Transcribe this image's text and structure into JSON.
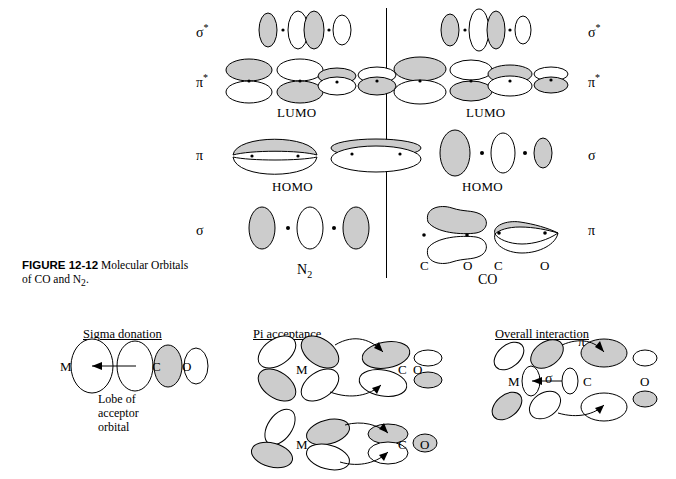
{
  "figure": {
    "caption_label": "FIGURE 12-12",
    "caption_text": " Molecular Orbitals of CO and N",
    "caption_sub": "2",
    "caption_end": "."
  },
  "panels": {
    "left": {
      "molecule": "N",
      "molecule_sub": "2",
      "orbital_labels": [
        {
          "id": "sigma-star",
          "text": "σ",
          "star": "*",
          "y": 30
        },
        {
          "id": "pi-star",
          "text": "π",
          "star": "*",
          "y": 80
        },
        {
          "id": "pi",
          "text": "π",
          "star": "",
          "y": 152
        },
        {
          "id": "sigma",
          "text": "σ",
          "star": "",
          "y": 228
        }
      ],
      "annotations": [
        {
          "id": "lumo",
          "text": "LUMO",
          "x": 277,
          "y": 112
        },
        {
          "id": "homo",
          "text": "HOMO",
          "x": 272,
          "y": 186
        }
      ]
    },
    "right": {
      "molecule": "CO",
      "atoms": [
        "C",
        "O",
        "C",
        "O"
      ],
      "orbital_labels": [
        {
          "id": "sigma-star",
          "text": "σ",
          "star": "*",
          "y": 30
        },
        {
          "id": "pi-star",
          "text": "π",
          "star": "*",
          "y": 80
        },
        {
          "id": "sigma",
          "text": "σ",
          "star": "",
          "y": 152
        },
        {
          "id": "pi",
          "text": "π",
          "star": "",
          "y": 228
        }
      ],
      "annotations": [
        {
          "id": "lumo",
          "text": "LUMO",
          "x": 466,
          "y": 112
        },
        {
          "id": "homo",
          "text": "HOMO",
          "x": 462,
          "y": 186
        }
      ]
    }
  },
  "bottom": {
    "sigma_donation": {
      "heading": "Sigma donation",
      "atom_m": "M",
      "atom_c": "C",
      "atom_o": "O",
      "note_line1": "Lobe of",
      "note_line2": "acceptor",
      "note_line3": "orbital"
    },
    "pi_acceptance": {
      "heading": "Pi acceptance",
      "top": {
        "atom_m": "M",
        "atom_c": "C",
        "atom_o": "O"
      },
      "bottom": {
        "atom_m": "M",
        "atom_c": "C",
        "atom_o": "O"
      }
    },
    "overall_interaction": {
      "heading": "Overall interaction",
      "atom_m": "M",
      "atom_c": "C",
      "atom_o": "O",
      "pi_symbol": "π",
      "sigma_symbol": "σ"
    }
  },
  "colors": {
    "shaded_lobe": "#cccccc",
    "empty_lobe": "#ffffff",
    "stroke": "#000000",
    "background": "#ffffff"
  }
}
